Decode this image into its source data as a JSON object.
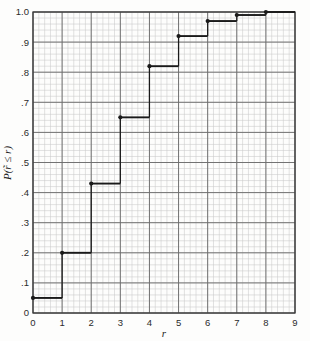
{
  "figure": {
    "name": "empirical-cdf-step-plot",
    "background_color": "#fdfdfc",
    "grid_minor_color": "#c9c9c9",
    "grid_major_color": "#6d6d6d",
    "curve_color": "#1a1a1a",
    "axis_color": "#3a3a3a"
  },
  "chart_data": {
    "type": "line",
    "subtype": "step-cdf",
    "title": "",
    "xlabel": "r",
    "ylabel": "P(r̃ ≤ r)",
    "xlim": [
      0,
      9
    ],
    "ylim": [
      0,
      1.0
    ],
    "grid": true,
    "grid_minor_x_step": 0.2,
    "grid_minor_y_step": 0.02,
    "grid_major_x_step": 1,
    "grid_major_y_step": 0.1,
    "legend": "none",
    "xticks": [
      0,
      1,
      2,
      3,
      4,
      5,
      6,
      7,
      8,
      9
    ],
    "xtick_labels": [
      "0",
      "1",
      "2",
      "3",
      "4",
      "5",
      "6",
      "7",
      "8",
      "9"
    ],
    "yticks": [
      0,
      0.1,
      0.2,
      0.3,
      0.4,
      0.5,
      0.6,
      0.7,
      0.8,
      0.9,
      1.0
    ],
    "ytick_labels": [
      "0",
      ".1",
      ".2",
      ".3",
      ".4",
      ".5",
      ".6",
      ".7",
      ".8",
      ".9",
      "1.0"
    ],
    "series": [
      {
        "name": "cumulative probability",
        "marker": "filled-circle-at-left-of-step",
        "steps": [
          {
            "x_start": 0,
            "x_end": 1,
            "y": 0.05
          },
          {
            "x_start": 1,
            "x_end": 2,
            "y": 0.2
          },
          {
            "x_start": 2,
            "x_end": 3,
            "y": 0.43
          },
          {
            "x_start": 3,
            "x_end": 4,
            "y": 0.65
          },
          {
            "x_start": 4,
            "x_end": 5,
            "y": 0.82
          },
          {
            "x_start": 5,
            "x_end": 6,
            "y": 0.92
          },
          {
            "x_start": 6,
            "x_end": 7,
            "y": 0.97
          },
          {
            "x_start": 7,
            "x_end": 8,
            "y": 0.99
          },
          {
            "x_start": 8,
            "x_end": 9,
            "y": 1.0
          }
        ],
        "x": [
          0,
          1,
          2,
          3,
          4,
          5,
          6,
          7,
          8
        ],
        "values": [
          0.05,
          0.2,
          0.43,
          0.65,
          0.82,
          0.92,
          0.97,
          0.99,
          1.0
        ]
      }
    ]
  }
}
